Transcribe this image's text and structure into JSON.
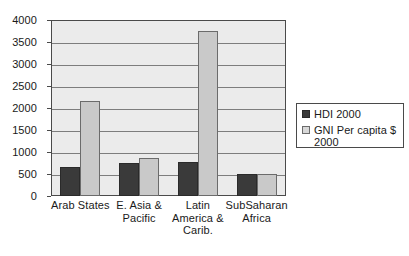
{
  "chart_data": {
    "type": "bar",
    "title": "",
    "subtitle": "",
    "xlabel": "",
    "ylabel": "",
    "ylim": [
      0,
      4000
    ],
    "ytick_values": [
      0,
      500,
      1000,
      1500,
      2000,
      2500,
      3000,
      3500,
      4000
    ],
    "ytick_labels": [
      "0",
      "500",
      "1000",
      "1500",
      "2000",
      "2500",
      "3000",
      "3500",
      "4000"
    ],
    "grid": true,
    "legend_position": "right",
    "categories": [
      "Arab States",
      "E. Asia & Pacific",
      "Latin America & Carib.",
      "SubSaharan Africa"
    ],
    "category_label_lines": [
      [
        "Arab States"
      ],
      [
        "E. Asia &",
        "Pacific"
      ],
      [
        "Latin",
        "America &",
        "Carib."
      ],
      [
        "SubSaharan",
        "Africa"
      ]
    ],
    "series": [
      {
        "name": "HDI 2000",
        "color": "#3a3a3a",
        "values": [
          650,
          740,
          770,
          490
        ]
      },
      {
        "name": "GNI Per capita $ 2000",
        "color": "#c9c9c9",
        "values": [
          2150,
          870,
          3750,
          490
        ]
      }
    ]
  },
  "legend": {
    "items": [
      {
        "label": "HDI 2000",
        "swatch": "hdi"
      },
      {
        "label": "GNI Per capita $ 2000",
        "swatch": "gni"
      }
    ]
  },
  "colors": {
    "plot_background": "#ebebeb",
    "gridline": "#7d7d7d",
    "axis": "#4a4a4a",
    "series_hdi": "#3a3a3a",
    "series_gni": "#c9c9c9",
    "page_background": "#ffffff"
  }
}
